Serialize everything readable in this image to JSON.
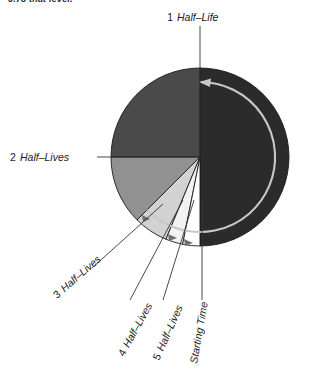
{
  "figure": {
    "clipped_caption": "0.78 that level.",
    "background_color": "#ffffff",
    "center": {
      "x": 200,
      "y": 157
    },
    "radius": 89
  },
  "chart_data": {
    "type": "pie",
    "title": "",
    "subtitle": "",
    "xlabel": "",
    "ylabel": "",
    "legend_position": "callout-labels",
    "grid": false,
    "rotation_direction": "counter-clockwise",
    "categories": [
      "1 Half-Life",
      "2 Half-Lives",
      "3 Half-Lives",
      "4 Half-Lives",
      "5 Half-Lives",
      "Starting Time"
    ],
    "slices": [
      {
        "name": "1 Half-Life",
        "fraction": 0.5,
        "degrees": 180,
        "start_angle": 270,
        "end_angle": 90,
        "color": "#2b2b2b"
      },
      {
        "name": "2 Half-Lives",
        "fraction": 0.25,
        "degrees": 90,
        "start_angle": 90,
        "end_angle": 180,
        "color": "#4a4a4a"
      },
      {
        "name": "3 Half-Lives",
        "fraction": 0.125,
        "degrees": 45,
        "start_angle": 180,
        "end_angle": 225,
        "color": "#919191"
      },
      {
        "name": "4 Half-Lives",
        "fraction": 0.0625,
        "degrees": 22.5,
        "start_angle": 225,
        "end_angle": 247.5,
        "color": "#d2d2d2"
      },
      {
        "name": "5 Half-Lives",
        "fraction": 0.03125,
        "degrees": 11.25,
        "start_angle": 247.5,
        "end_angle": 258.75,
        "color": "#f2f2f2"
      },
      {
        "name": "Remaining",
        "fraction": 0.03125,
        "degrees": 11.25,
        "start_angle": 258.75,
        "end_angle": 270,
        "color": "#ffffff"
      }
    ],
    "values": [
      0.5,
      0.25,
      0.125,
      0.0625,
      0.03125,
      0.03125
    ],
    "colors": [
      "#2b2b2b",
      "#4a4a4a",
      "#919191",
      "#d2d2d2",
      "#f2f2f2",
      "#ffffff"
    ]
  },
  "labels": {
    "half_life_1": "1 Half-Life",
    "half_lives_2": "2 Half-Lives",
    "half_lives_3": "3 Half-Lives",
    "half_lives_4": "4 Half-Lives",
    "half_lives_5": "5 Half-Lives",
    "starting_time": "Starting Time"
  },
  "arrow": {
    "name": "decay-direction-arrow",
    "color": "#c8c8c8",
    "direction": "counter-clockwise"
  }
}
